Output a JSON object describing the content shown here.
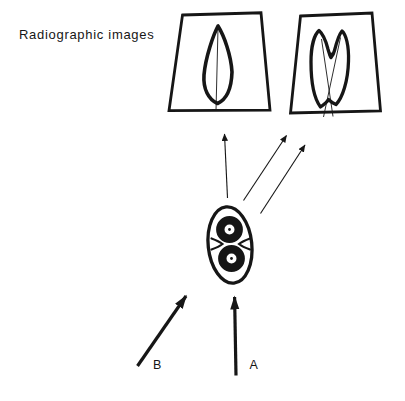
{
  "title": "Radiographic images",
  "labels": {
    "beam_a": "A",
    "beam_b": "B"
  },
  "colors": {
    "ink": "#161616",
    "paper": "#ffffff"
  }
}
